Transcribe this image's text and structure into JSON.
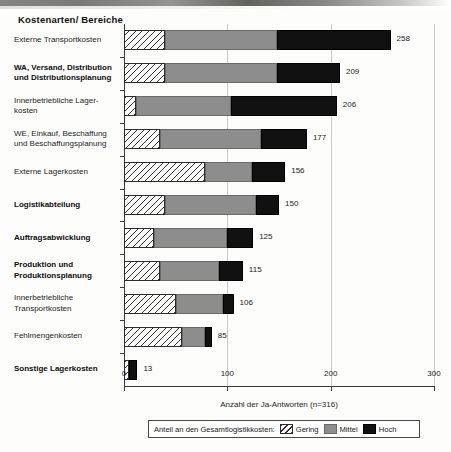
{
  "chart_data": {
    "type": "bar",
    "orientation": "horizontal",
    "stacked": true,
    "title": "Kostenarten/ Bereiche",
    "xlabel": "Anzahl der Ja-Antworten (n=316)",
    "ylabel": "",
    "xlim": [
      0,
      300
    ],
    "xticks": [
      0,
      100,
      200,
      300
    ],
    "xtick_labels": [
      "0",
      "100",
      "200",
      "300"
    ],
    "grid": "vertical-at-xticks",
    "legend_position": "below-axis",
    "legend_title": "Anteil an den Gesamtlogistikkosten:",
    "series": [
      {
        "name": "Gering",
        "fill": "diagonal-hatch",
        "values": [
          40,
          40,
          12,
          35,
          78,
          40,
          29,
          35,
          50,
          56,
          5
        ]
      },
      {
        "name": "Mittel",
        "fill": "gray",
        "values": [
          108,
          108,
          92,
          98,
          46,
          88,
          71,
          57,
          46,
          22,
          0
        ]
      },
      {
        "name": "Hoch",
        "fill": "black",
        "values": [
          110,
          61,
          102,
          44,
          32,
          22,
          25,
          23,
          10,
          7,
          8
        ]
      }
    ],
    "categories": [
      "Externe Transportkosten",
      "WA, Versand, Distribution und Distributionsplanung",
      "Innerbetriebliche Lagerkosten",
      "WE, Einkauf, Beschaffung und Beschaffungsplanung",
      "Externe Lagerkosten",
      "Logistikabteilung",
      "Auftragsabwicklung",
      "Produktion und Produktionsplanung",
      "Innerbetriebliche Transportkosten",
      "Fehlmengenkosten",
      "Sonstige Lagerkosten"
    ],
    "totals": [
      258,
      209,
      206,
      177,
      156,
      150,
      125,
      115,
      106,
      85,
      13
    ],
    "total_labels": [
      "258",
      "209",
      "206",
      "177",
      "156",
      "150",
      "125",
      "115",
      "106",
      "85",
      "13"
    ]
  },
  "categories_display": [
    {
      "lines": [
        "Externe Transportkosten"
      ],
      "bold": false
    },
    {
      "lines": [
        "WA, Versand, Distribution",
        "und Distributionsplanung"
      ],
      "bold": true
    },
    {
      "lines": [
        "Innerbetriebliche Lager-",
        "kosten"
      ],
      "bold": false
    },
    {
      "lines": [
        "WE, Einkauf, Beschaffung",
        "und Beschaffungsplanung"
      ],
      "bold": false
    },
    {
      "lines": [
        "Externe Lagerkosten"
      ],
      "bold": false
    },
    {
      "lines": [
        "Logistikabteilung"
      ],
      "bold": true
    },
    {
      "lines": [
        "Auftragsabwicklung"
      ],
      "bold": true
    },
    {
      "lines": [
        "Produktion und",
        "Produktionsplanung"
      ],
      "bold": true
    },
    {
      "lines": [
        "Innerbetriebliche",
        "Transportkosten"
      ],
      "bold": false
    },
    {
      "lines": [
        "Fehlmengenkosten"
      ],
      "bold": false
    },
    {
      "lines": [
        "Sonstige Lagerkosten"
      ],
      "bold": true
    }
  ],
  "legend": {
    "title": "Anteil an den Gesamtlogistikkosten:",
    "items": [
      {
        "label": "Gering",
        "style": "gering"
      },
      {
        "label": "Mittel",
        "style": "mittel"
      },
      {
        "label": "Hoch",
        "style": "hoch"
      }
    ]
  },
  "colors": {
    "gering": "#ffffff",
    "mittel": "#8d8d8d",
    "hoch": "#111111",
    "axis": "#3a3a3a",
    "grid": "#c9c9c7"
  }
}
